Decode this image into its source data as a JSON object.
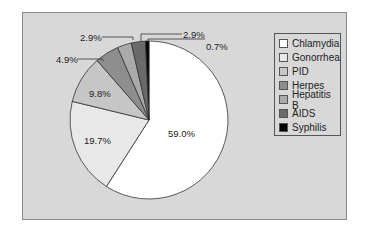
{
  "chart_data": {
    "type": "pie",
    "title": "",
    "categories": [
      "Chlamydia",
      "Gonorrhea",
      "PID",
      "Herpes",
      "Hepatitis B",
      "AIDS",
      "Syphilis"
    ],
    "values": [
      59.0,
      19.7,
      9.8,
      4.9,
      2.9,
      2.9,
      0.7
    ],
    "labels": [
      "59.0%",
      "19.7%",
      "9.8%",
      "4.9%",
      "2.9%",
      "2.9%",
      "0.7%"
    ],
    "colors": [
      "#ffffff",
      "#e8e8e8",
      "#c6c6c6",
      "#8e8e8e",
      "#aaaaaa",
      "#6a6a6a",
      "#000000"
    ],
    "legend_position": "right",
    "start_angle": "12 o'clock",
    "direction": "clockwise"
  },
  "legend": {
    "items": [
      {
        "label": "Chlamydia",
        "color": "#ffffff"
      },
      {
        "label": "Gonorrhea",
        "color": "#e8e8e8"
      },
      {
        "label": "PID",
        "color": "#c6c6c6"
      },
      {
        "label": "Herpes",
        "color": "#8e8e8e"
      },
      {
        "label": "Hepatitis B",
        "color": "#aaaaaa"
      },
      {
        "label": "AIDS",
        "color": "#6a6a6a"
      },
      {
        "label": "Syphilis",
        "color": "#000000"
      }
    ]
  }
}
